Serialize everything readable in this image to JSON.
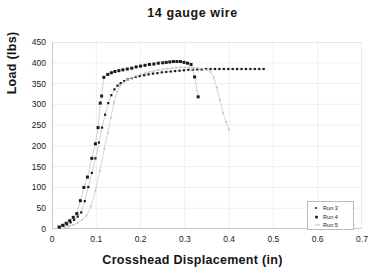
{
  "chart_data": {
    "type": "scatter",
    "title": "14  gauge  wire",
    "xlabel": "Crosshead  Displacement  (in)",
    "ylabel": "Load  (lbs)",
    "xlim": [
      0,
      0.7
    ],
    "ylim": [
      0,
      450
    ],
    "xticks": [
      "0",
      "0.1",
      "0.2",
      "0.3",
      "0.4",
      "0.5",
      "0.6",
      "0.7"
    ],
    "xtick_values": [
      0,
      0.1,
      0.2,
      0.3,
      0.4,
      0.5,
      0.6,
      0.7
    ],
    "yticks": [
      "0",
      "50",
      "100",
      "150",
      "200",
      "250",
      "300",
      "350",
      "400",
      "450"
    ],
    "ytick_values": [
      0,
      50,
      100,
      150,
      200,
      250,
      300,
      350,
      400,
      450
    ],
    "grid": true,
    "legend_position": "lower right",
    "series": [
      {
        "name": "Run 3",
        "marker": "small-dot",
        "color": "#1a1a1a",
        "points": [
          [
            0.018,
            4
          ],
          [
            0.026,
            8
          ],
          [
            0.034,
            11
          ],
          [
            0.042,
            16
          ],
          [
            0.05,
            22
          ],
          [
            0.058,
            30
          ],
          [
            0.066,
            40
          ],
          [
            0.074,
            67
          ],
          [
            0.082,
            101
          ],
          [
            0.09,
            135
          ],
          [
            0.098,
            170
          ],
          [
            0.106,
            208
          ],
          [
            0.113,
            244
          ],
          [
            0.12,
            275
          ],
          [
            0.127,
            303
          ],
          [
            0.134,
            322
          ],
          [
            0.141,
            336
          ],
          [
            0.148,
            345
          ],
          [
            0.155,
            351
          ],
          [
            0.163,
            356
          ],
          [
            0.171,
            360
          ],
          [
            0.18,
            363
          ],
          [
            0.189,
            366
          ],
          [
            0.198,
            368
          ],
          [
            0.208,
            370
          ],
          [
            0.218,
            372
          ],
          [
            0.228,
            374
          ],
          [
            0.238,
            375
          ],
          [
            0.248,
            377
          ],
          [
            0.258,
            378
          ],
          [
            0.268,
            379
          ],
          [
            0.278,
            380
          ],
          [
            0.288,
            381
          ],
          [
            0.298,
            382
          ],
          [
            0.308,
            383
          ],
          [
            0.318,
            383
          ],
          [
            0.328,
            384
          ],
          [
            0.338,
            384
          ],
          [
            0.348,
            385
          ],
          [
            0.358,
            385
          ],
          [
            0.368,
            385
          ],
          [
            0.378,
            385
          ],
          [
            0.388,
            385
          ],
          [
            0.398,
            385
          ],
          [
            0.408,
            385
          ],
          [
            0.418,
            385
          ],
          [
            0.428,
            385
          ],
          [
            0.438,
            385
          ],
          [
            0.448,
            385
          ],
          [
            0.458,
            385
          ],
          [
            0.468,
            385
          ],
          [
            0.478,
            385
          ]
        ]
      },
      {
        "name": "Run 4",
        "marker": "square-dot",
        "color": "#1a1a1a",
        "points": [
          [
            0.016,
            5
          ],
          [
            0.024,
            9
          ],
          [
            0.032,
            14
          ],
          [
            0.04,
            20
          ],
          [
            0.048,
            28
          ],
          [
            0.056,
            37
          ],
          [
            0.064,
            68
          ],
          [
            0.072,
            100
          ],
          [
            0.08,
            125
          ],
          [
            0.09,
            170
          ],
          [
            0.098,
            205
          ],
          [
            0.104,
            244
          ],
          [
            0.109,
            303
          ],
          [
            0.112,
            320
          ],
          [
            0.117,
            365
          ],
          [
            0.126,
            372
          ],
          [
            0.134,
            376
          ],
          [
            0.142,
            379
          ],
          [
            0.151,
            381
          ],
          [
            0.16,
            383
          ],
          [
            0.17,
            385
          ],
          [
            0.18,
            387
          ],
          [
            0.19,
            390
          ],
          [
            0.2,
            392
          ],
          [
            0.21,
            394
          ],
          [
            0.22,
            396
          ],
          [
            0.23,
            397
          ],
          [
            0.24,
            399
          ],
          [
            0.25,
            400
          ],
          [
            0.258,
            401
          ],
          [
            0.266,
            402
          ],
          [
            0.274,
            403
          ],
          [
            0.282,
            403
          ],
          [
            0.29,
            403
          ],
          [
            0.298,
            401
          ],
          [
            0.306,
            399
          ],
          [
            0.314,
            396
          ],
          [
            0.322,
            366
          ],
          [
            0.33,
            318
          ]
        ]
      },
      {
        "name": "Run 5",
        "marker": "tiny-dot",
        "color": "#b8b8b8",
        "points": [
          [
            0.028,
            3
          ],
          [
            0.038,
            6
          ],
          [
            0.048,
            10
          ],
          [
            0.058,
            15
          ],
          [
            0.068,
            22
          ],
          [
            0.078,
            32
          ],
          [
            0.088,
            55
          ],
          [
            0.098,
            92
          ],
          [
            0.108,
            140
          ],
          [
            0.118,
            193
          ],
          [
            0.126,
            232
          ],
          [
            0.133,
            268
          ],
          [
            0.14,
            305
          ],
          [
            0.147,
            330
          ],
          [
            0.154,
            345
          ],
          [
            0.162,
            353
          ],
          [
            0.171,
            359
          ],
          [
            0.18,
            364
          ],
          [
            0.19,
            368
          ],
          [
            0.2,
            372
          ],
          [
            0.21,
            375
          ],
          [
            0.22,
            378
          ],
          [
            0.23,
            380
          ],
          [
            0.24,
            382
          ],
          [
            0.25,
            384
          ],
          [
            0.26,
            386
          ],
          [
            0.27,
            387
          ],
          [
            0.28,
            388
          ],
          [
            0.29,
            389
          ],
          [
            0.3,
            389
          ],
          [
            0.31,
            389
          ],
          [
            0.32,
            388
          ],
          [
            0.33,
            387
          ],
          [
            0.34,
            386
          ],
          [
            0.35,
            383
          ],
          [
            0.358,
            378
          ],
          [
            0.365,
            365
          ],
          [
            0.372,
            340
          ],
          [
            0.379,
            310
          ],
          [
            0.386,
            280
          ],
          [
            0.393,
            258
          ],
          [
            0.4,
            239
          ]
        ]
      }
    ]
  }
}
